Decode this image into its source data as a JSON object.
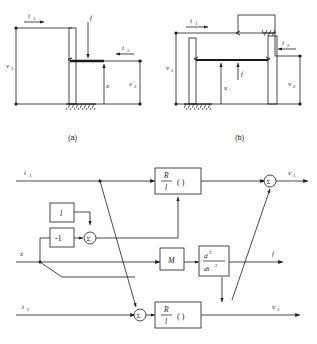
{
  "figure": {
    "caption_a": "(a)",
    "caption_b": "(b)"
  },
  "schematic_a": {
    "labels": {
      "i1": "i",
      "i1_sub": "1",
      "i2": "i",
      "i2_sub": "2",
      "f": "f",
      "x": "x",
      "v1": "v",
      "v1_sub": "1",
      "v2": "v",
      "v2_sub": "2"
    }
  },
  "schematic_b": {
    "labels": {
      "i1": "i",
      "i1_sub": "1",
      "i2": "i",
      "i2_sub": "2",
      "f": "f",
      "x": "x",
      "v1": "v",
      "v1_sub": "1",
      "v2": "v",
      "v2_sub": "2"
    }
  },
  "block_diagram": {
    "inputs": [
      {
        "name": "i1",
        "base": "i",
        "sub": "1"
      },
      {
        "name": "x",
        "base": "x",
        "sub": ""
      },
      {
        "name": "i2",
        "base": "i",
        "sub": "2"
      }
    ],
    "outputs": [
      {
        "name": "v1",
        "base": "v",
        "sub": "1"
      },
      {
        "name": "f",
        "base": "f",
        "sub": ""
      },
      {
        "name": "v2",
        "base": "v",
        "sub": "2"
      }
    ],
    "blocks": [
      {
        "id": "gain_l",
        "label": "l"
      },
      {
        "id": "gain_neg1",
        "label": "-1"
      },
      {
        "id": "rl_top",
        "numerator": "R",
        "denominator": "l",
        "suffix": "( )"
      },
      {
        "id": "mass_m",
        "label": "M"
      },
      {
        "id": "deriv",
        "numerator": "d",
        "num_sup": "2",
        "denominator": "dt",
        "den_sup": "2"
      },
      {
        "id": "rl_bottom",
        "numerator": "R",
        "denominator": "l",
        "suffix": "( )"
      }
    ],
    "summers": [
      {
        "id": "sum_mid",
        "label": "Σ"
      },
      {
        "id": "sum_out_v1",
        "label": "Σ"
      },
      {
        "id": "sum_bottom",
        "label": "Σ"
      }
    ]
  },
  "colors": {
    "line": "#1a1a1a",
    "background": "#ffffff"
  }
}
